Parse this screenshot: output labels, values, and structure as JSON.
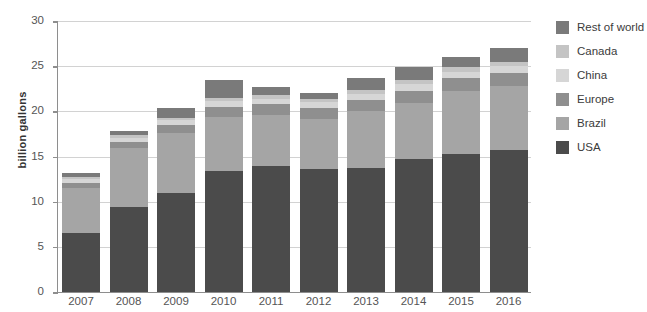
{
  "chart_data": {
    "type": "bar",
    "stacked": true,
    "title": "",
    "xlabel": "",
    "ylabel": "billion gallons",
    "ylim": [
      0,
      30
    ],
    "yticks": [
      0,
      5,
      10,
      15,
      20,
      25,
      30
    ],
    "grid": true,
    "legend_position": "right",
    "categories": [
      "2007",
      "2008",
      "2009",
      "2010",
      "2011",
      "2012",
      "2013",
      "2014",
      "2015",
      "2016"
    ],
    "series": [
      {
        "name": "USA",
        "color": "#4b4b4b",
        "values": [
          6.5,
          9.4,
          11.0,
          13.4,
          14.0,
          13.6,
          13.7,
          14.7,
          15.3,
          15.7
        ]
      },
      {
        "name": "Brazil",
        "color": "#a5a5a5",
        "values": [
          5.0,
          6.5,
          6.6,
          6.0,
          5.6,
          5.6,
          6.3,
          6.2,
          7.0,
          7.1
        ]
      },
      {
        "name": "Europe",
        "color": "#8f8f8f",
        "values": [
          0.6,
          0.7,
          0.9,
          1.1,
          1.2,
          1.2,
          1.3,
          1.4,
          1.4,
          1.4
        ]
      },
      {
        "name": "China",
        "color": "#d6d6d6",
        "values": [
          0.4,
          0.5,
          0.5,
          0.6,
          0.6,
          0.6,
          0.6,
          0.7,
          0.7,
          0.8
        ]
      },
      {
        "name": "Canada",
        "color": "#c4c4c4",
        "values": [
          0.2,
          0.3,
          0.3,
          0.4,
          0.4,
          0.4,
          0.5,
          0.5,
          0.5,
          0.5
        ]
      },
      {
        "name": "Rest of world",
        "color": "#7a7a7a",
        "values": [
          0.5,
          0.4,
          1.1,
          2.0,
          0.9,
          0.6,
          1.3,
          1.4,
          1.1,
          1.5
        ]
      }
    ],
    "totals": [
      13.2,
      17.8,
      20.4,
      23.5,
      22.7,
      22.0,
      23.7,
      24.9,
      26.0,
      27.0
    ]
  },
  "legend": {
    "entries": [
      {
        "label": "Rest of world",
        "color": "#7a7a7a"
      },
      {
        "label": "Canada",
        "color": "#c4c4c4"
      },
      {
        "label": "China",
        "color": "#d6d6d6"
      },
      {
        "label": "Europe",
        "color": "#8f8f8f"
      },
      {
        "label": "Brazil",
        "color": "#a5a5a5"
      },
      {
        "label": "USA",
        "color": "#4b4b4b"
      }
    ]
  },
  "axis": {
    "y_title": "billion gallons"
  }
}
